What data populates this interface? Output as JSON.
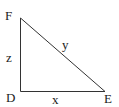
{
  "diagram": {
    "type": "right-triangle",
    "vertices": {
      "F": {
        "label": "F"
      },
      "D": {
        "label": "D"
      },
      "E": {
        "label": "E"
      }
    },
    "sides": {
      "FD": {
        "label": "z"
      },
      "DE": {
        "label": "x"
      },
      "FE": {
        "label": "y"
      }
    },
    "right_angle_at": "D",
    "colors": {
      "stroke": "#333333",
      "text": "#222222",
      "background": "#ffffff"
    }
  }
}
